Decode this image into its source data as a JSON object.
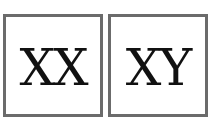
{
  "boxes": [
    {
      "label": "XX"
    },
    {
      "label": "XY"
    }
  ],
  "colors": {
    "border": "#6b6b6b",
    "text": "#111111",
    "background": "#ffffff"
  }
}
